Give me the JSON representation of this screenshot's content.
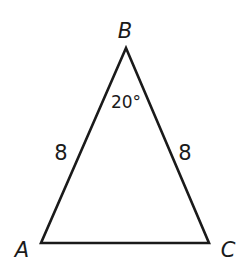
{
  "diagram": {
    "type": "triangle",
    "vertices": [
      {
        "name": "B",
        "label": "B",
        "x": 126,
        "y": 48,
        "label_x": 125,
        "label_y": 38
      },
      {
        "name": "A",
        "label": "A",
        "x": 41,
        "y": 243,
        "label_x": 22,
        "label_y": 257
      },
      {
        "name": "C",
        "label": "C",
        "x": 209,
        "y": 243,
        "label_x": 228,
        "label_y": 257
      }
    ],
    "sides": [
      {
        "from": "A",
        "to": "B",
        "length_label": "8",
        "label_x": 61,
        "label_y": 160
      },
      {
        "from": "B",
        "to": "C",
        "length_label": "8",
        "label_x": 185,
        "label_y": 160
      }
    ],
    "angle": {
      "vertex": "B",
      "label": "20°",
      "label_x": 126,
      "label_y": 108
    },
    "stroke_color": "#1a1a1a"
  }
}
